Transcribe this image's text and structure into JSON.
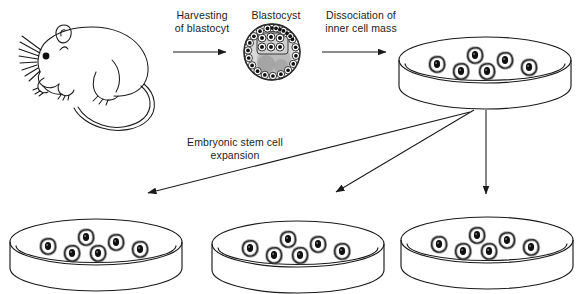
{
  "diagram": {
    "background_color": "#ffffff",
    "line_color": "#1a1a1a",
    "labels": {
      "harvesting": "Harvesting\nof blastocyt",
      "blastocyst": "Blastocyst",
      "dissociation": "Dissociation of\ninner cell mass",
      "expansion": "Embryonic stem cell\nexpansion"
    },
    "stages": [
      {
        "name": "mouse",
        "kind": "animal-illustration",
        "description": "Line drawing of a mouse facing left with whiskers, ear, eye, paws and long curved tail"
      },
      {
        "name": "blastocyst",
        "kind": "embryo",
        "description": "Spherical blastocyst with ring of trophoblast cells and inner cell mass",
        "trophoblast_cell_count": 22
      },
      {
        "name": "culture-dish-top-right",
        "kind": "petri-dish",
        "cell_count": 6
      },
      {
        "name": "culture-dish-bottom-left",
        "kind": "petri-dish",
        "cell_count": 6
      },
      {
        "name": "culture-dish-bottom-middle",
        "kind": "petri-dish",
        "cell_count": 6
      },
      {
        "name": "culture-dish-bottom-right",
        "kind": "petri-dish",
        "cell_count": 6
      }
    ],
    "arrows": [
      {
        "name": "arrow-mouse-to-blastocyst",
        "direction": "right"
      },
      {
        "name": "arrow-blastocyst-to-dish",
        "direction": "right"
      },
      {
        "name": "arrow-to-bottom-left-dish",
        "direction": "down-left"
      },
      {
        "name": "arrow-to-bottom-middle-dish",
        "direction": "down-left"
      },
      {
        "name": "arrow-to-bottom-right-dish",
        "direction": "down"
      }
    ]
  }
}
